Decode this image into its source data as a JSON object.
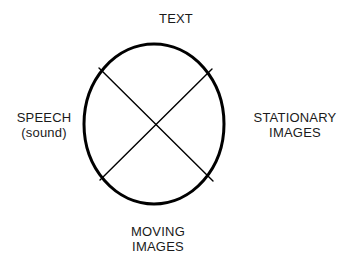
{
  "diagram": {
    "title": "TEXT",
    "shape": "circle-with-x",
    "stroke_color": "#000000",
    "background_color": "#ffffff",
    "circle": {
      "center_x": 154,
      "center_y": 124,
      "radius_x": 70,
      "radius_y": 80,
      "stroke_width": 3
    },
    "diagonals": {
      "stroke_width": 1.4,
      "lines": [
        {
          "x1": 99,
          "y1": 68,
          "x2": 213,
          "y2": 181
        },
        {
          "x1": 212,
          "y1": 69,
          "x2": 100,
          "y2": 180
        }
      ]
    },
    "labels": {
      "top": {
        "line1": "TEXT"
      },
      "left": {
        "line1": "SPEECH",
        "line2": "(sound)"
      },
      "right": {
        "line1": "STATIONARY",
        "line2": "IMAGES"
      },
      "bottom": {
        "line1": "MOVING",
        "line2": "IMAGES"
      }
    }
  }
}
